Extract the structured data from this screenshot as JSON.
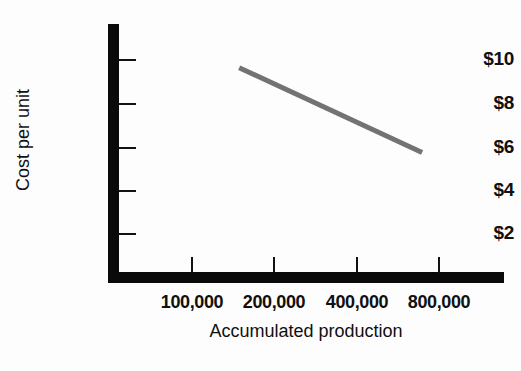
{
  "chart_data": {
    "type": "line",
    "title": "",
    "subtitle": "",
    "xlabel": "Accumulated production",
    "ylabel": "Cost per unit",
    "x_scale": "log2",
    "grid": false,
    "legend": null,
    "x_tick_labels": [
      "100,000",
      "200,000",
      "400,000",
      "800,000"
    ],
    "x_tick_values": [
      100000,
      200000,
      400000,
      800000
    ],
    "y_tick_labels": [
      "$10",
      "$8",
      "$6",
      "$4",
      "$2"
    ],
    "y_tick_values": [
      10,
      8,
      6,
      4,
      2
    ],
    "ylim": [
      0,
      11.4
    ],
    "series": [
      {
        "name": "Experience curve",
        "color": "#737373",
        "line_width_px": 5,
        "x": [
          150000,
          700000
        ],
        "values": [
          9.6,
          5.7
        ]
      }
    ],
    "annotations": []
  },
  "axes": {
    "y": {
      "title": "Cost per unit",
      "ticks": [
        {
          "label": "$10",
          "value": 10
        },
        {
          "label": "$8",
          "value": 8
        },
        {
          "label": "$6",
          "value": 6
        },
        {
          "label": "$4",
          "value": 4
        },
        {
          "label": "$2",
          "value": 2
        }
      ]
    },
    "x": {
      "title": "Accumulated production",
      "ticks": [
        {
          "label": "100,000",
          "value": 100000
        },
        {
          "label": "200,000",
          "value": 200000
        },
        {
          "label": "400,000",
          "value": 400000
        },
        {
          "label": "800,000",
          "value": 800000
        }
      ]
    }
  },
  "colors": {
    "background": "#fdfdfd",
    "axis": "#0a0a0a",
    "text": "#101010",
    "series_line": "#737373"
  }
}
